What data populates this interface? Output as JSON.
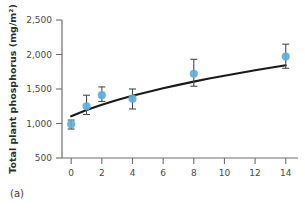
{
  "figure": {
    "panel_label": "(a)",
    "background_color": "#ffffff"
  },
  "chart_data": {
    "type": "scatter",
    "title": "",
    "subtitle": "",
    "xlabel": "",
    "ylabel": "Total plant phosphorus (mg/m²)",
    "xlim": [
      -0.6,
      14.8
    ],
    "ylim": [
      500,
      2500
    ],
    "xticks": [
      0,
      2,
      4,
      6,
      8,
      10,
      12,
      14
    ],
    "xticklabels": [
      "0",
      "2",
      "4",
      "6",
      "8",
      "10",
      "12",
      "14"
    ],
    "yticks": [
      500,
      1000,
      1500,
      2000,
      2500
    ],
    "yticklabels": [
      "500",
      "1,000",
      "1,500",
      "2,000",
      "2,500"
    ],
    "grid": false,
    "legend": null,
    "marker_color": "#5BAEDC",
    "errorbar_color": "#4a4a4a",
    "fit_line_color": "#1a1a1a",
    "x": [
      0,
      1,
      2,
      4,
      8,
      14
    ],
    "values": [
      990,
      1250,
      1410,
      1360,
      1720,
      1970
    ],
    "error_low": [
      920,
      1130,
      1320,
      1210,
      1540,
      1800
    ],
    "error_high": [
      1050,
      1410,
      1530,
      1500,
      1930,
      2150
    ],
    "series": [
      {
        "name": "Total plant phosphorus",
        "x": [
          0,
          1,
          2,
          4,
          8,
          14
        ],
        "values": [
          990,
          1250,
          1410,
          1360,
          1720,
          1970
        ],
        "error_low": [
          920,
          1130,
          1320,
          1210,
          1540,
          1800
        ],
        "error_high": [
          1050,
          1410,
          1530,
          1500,
          1930,
          2150
        ]
      }
    ],
    "fit_curve": {
      "name": "fitted saturating curve",
      "x": [
        0,
        1,
        2,
        3,
        4,
        5,
        6,
        7,
        8,
        9,
        10,
        11,
        12,
        13,
        14
      ],
      "values": [
        1105,
        1195,
        1272,
        1340,
        1402,
        1458,
        1511,
        1560,
        1607,
        1651,
        1693,
        1733,
        1772,
        1809,
        1845
      ]
    }
  }
}
